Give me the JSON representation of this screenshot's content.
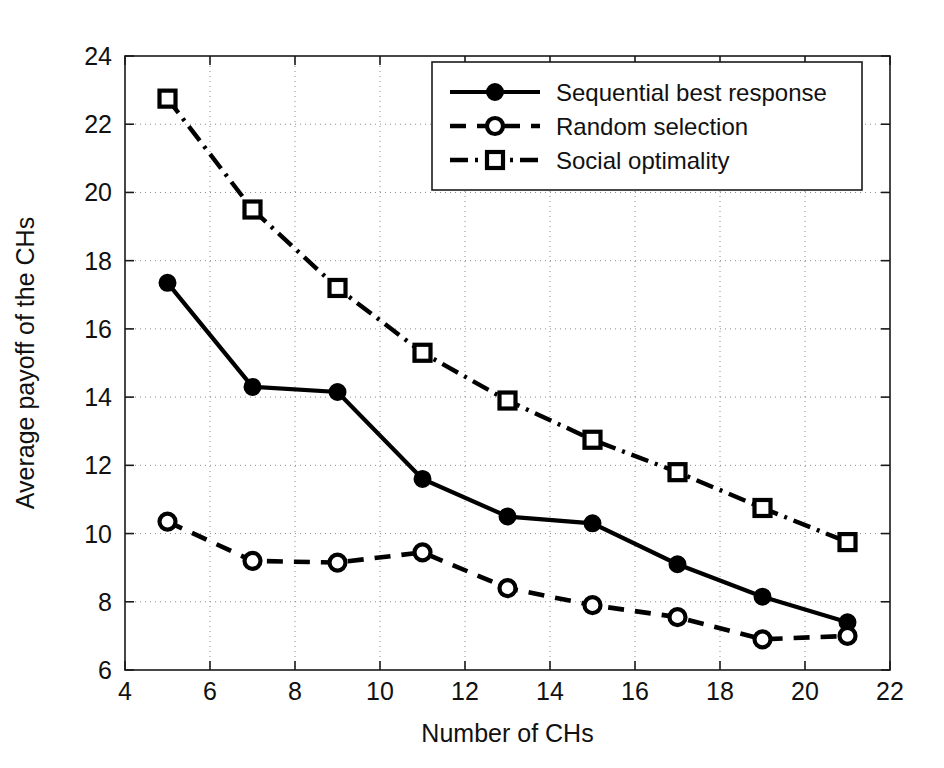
{
  "chart_data": {
    "type": "line",
    "title": "",
    "xlabel": "Number of CHs",
    "ylabel": "Average payoff of the CHs",
    "xlim": [
      4,
      22
    ],
    "ylim": [
      6,
      24
    ],
    "xticks": [
      4,
      6,
      8,
      10,
      12,
      14,
      16,
      18,
      20,
      22
    ],
    "yticks": [
      6,
      8,
      10,
      12,
      14,
      16,
      18,
      20,
      22,
      24
    ],
    "grid": true,
    "legend_position": "top-right",
    "x": [
      5,
      7,
      9,
      11,
      13,
      15,
      17,
      19,
      21
    ],
    "series": [
      {
        "name": "Sequential best response",
        "marker": "filled-circle",
        "linestyle": "solid",
        "values": [
          17.35,
          14.3,
          14.15,
          11.6,
          10.5,
          10.3,
          9.1,
          8.15,
          7.4
        ]
      },
      {
        "name": "Random selection",
        "marker": "open-circle",
        "linestyle": "dashed",
        "values": [
          10.35,
          9.2,
          9.15,
          9.45,
          8.4,
          7.9,
          7.55,
          6.9,
          7.0
        ]
      },
      {
        "name": "Social optimality",
        "marker": "open-square",
        "linestyle": "dash-dot",
        "values": [
          22.75,
          19.5,
          17.2,
          15.3,
          13.9,
          12.75,
          11.8,
          10.75,
          9.75
        ]
      }
    ]
  },
  "colors": {
    "line": "#000000",
    "grid": "#8a8a8a",
    "axis": "#1a1a1a",
    "background": "#ffffff"
  }
}
